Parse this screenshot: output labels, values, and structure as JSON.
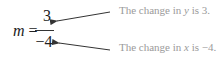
{
  "equation": {
    "variable": "m",
    "equals": "=",
    "numerator": "3",
    "denominator": "−4"
  },
  "annotations": [
    {
      "prefix": "The change in ",
      "variable": "y",
      "suffix": " is 3.",
      "points_to": "numerator"
    },
    {
      "prefix": "The change in ",
      "variable": "x",
      "suffix": " is −4.",
      "points_to": "denominator"
    }
  ],
  "colors": {
    "equation_text": "#222222",
    "annotation_text": "#9a9a9a",
    "arrow": "#333333"
  }
}
